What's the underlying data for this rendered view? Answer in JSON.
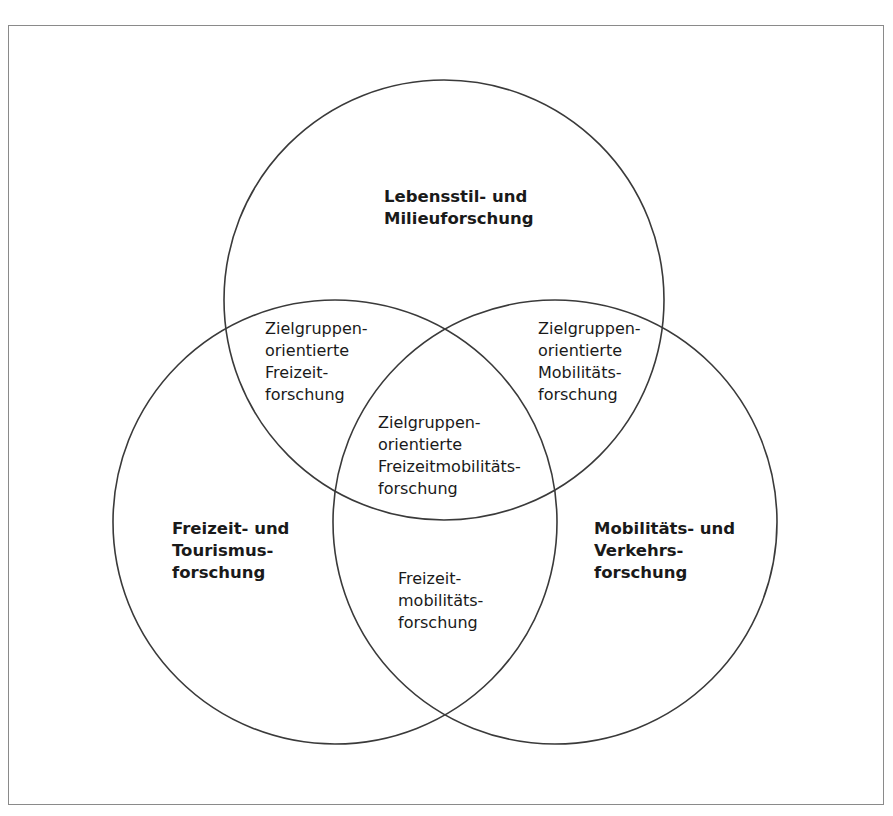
{
  "diagram": {
    "type": "venn",
    "circles": [
      {
        "id": "top",
        "label": "Lebensstil- und\nMilieuforschung",
        "cx": 444,
        "cy": 300,
        "r": 220
      },
      {
        "id": "left",
        "label": "Freizeit- und\nTourismus-\nforschung",
        "cx": 335,
        "cy": 522,
        "r": 222
      },
      {
        "id": "right",
        "label": "Mobilitäts- und\nVerkehrs-\nforschung",
        "cx": 555,
        "cy": 522,
        "r": 222
      }
    ],
    "labels": {
      "top": [
        "Lebensstil- und",
        "Milieuforschung"
      ],
      "left": [
        "Freizeit- und",
        "Tourismus-",
        "forschung"
      ],
      "right": [
        "Mobilitäts- und",
        "Verkehrs-",
        "forschung"
      ],
      "top_left": [
        "Zielgruppen-",
        "orientierte",
        "Freizeit-",
        "forschung"
      ],
      "top_right": [
        "Zielgruppen-",
        "orientierte",
        "Mobilitäts-",
        "forschung"
      ],
      "center": [
        "Zielgruppen-",
        "orientierte",
        "Freizeitmobilitäts-",
        "forschung"
      ],
      "left_right": [
        "Freizeit-",
        "mobilitäts-",
        "forschung"
      ]
    },
    "stroke_color": "#3a3a3a",
    "frame_color": "#8a8a8a"
  }
}
